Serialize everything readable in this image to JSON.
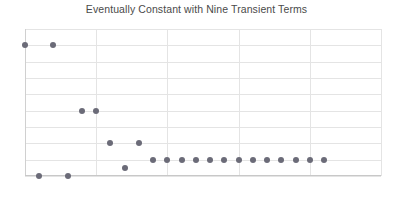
{
  "chart_data": {
    "type": "scatter",
    "title": "Eventually Constant with Nine Transient Terms",
    "xlabel": "",
    "ylabel": "",
    "xlim": [
      0,
      25
    ],
    "ylim": [
      0,
      9
    ],
    "xticks": [
      "0",
      "5",
      "10",
      "15",
      "20",
      "25"
    ],
    "xtick_values": [
      0,
      5,
      10,
      15,
      20,
      25
    ],
    "yticks": [
      "0",
      "1",
      "2",
      "3",
      "4",
      "5",
      "6",
      "7",
      "8",
      "9"
    ],
    "ytick_values": [
      0,
      1,
      2,
      3,
      4,
      5,
      6,
      7,
      8,
      9
    ],
    "grid": true,
    "legend": false,
    "marker_color": "#6b6b78",
    "series": [
      {
        "name": "sequence",
        "x": [
          0,
          1,
          2,
          3,
          4,
          5,
          6,
          7,
          8,
          9,
          10,
          11,
          12,
          13,
          14,
          15,
          16,
          17,
          18,
          19,
          20,
          21
        ],
        "y": [
          8,
          0,
          8,
          0,
          4,
          4,
          2,
          0.5,
          2,
          1,
          1,
          1,
          1,
          1,
          1,
          1,
          1,
          1,
          1,
          1,
          1,
          1
        ]
      }
    ]
  }
}
